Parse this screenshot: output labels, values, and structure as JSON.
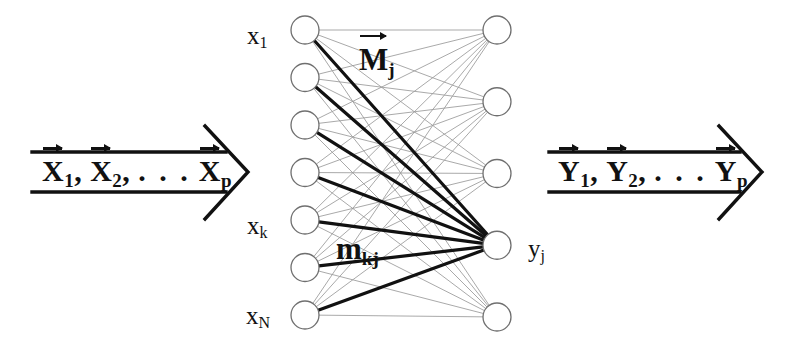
{
  "figure": {
    "kind": "neural-network-diagram",
    "background_color": "#ffffff",
    "ink_color": "#111111",
    "mesh_color": "#9a9a9a"
  },
  "input_arrow": {
    "name": "input-vector-arrow",
    "direction": "right",
    "text_main": "X",
    "items": [
      {
        "symbol": "X",
        "subscript": "1",
        "vector": true,
        "separator": ","
      },
      {
        "symbol": "X",
        "subscript": "2",
        "vector": true,
        "separator": ","
      },
      {
        "symbol": "X",
        "subscript": "p",
        "vector": true,
        "separator": ""
      }
    ],
    "ellipsis": ". . .",
    "full_text": "X1, X2, ... Xp"
  },
  "output_arrow": {
    "name": "output-vector-arrow",
    "direction": "right",
    "text_main": "Y",
    "items": [
      {
        "symbol": "Y",
        "subscript": "1",
        "vector": true,
        "separator": ","
      },
      {
        "symbol": "Y",
        "subscript": "2",
        "vector": true,
        "separator": ","
      },
      {
        "symbol": "Y",
        "subscript": "p",
        "vector": true,
        "separator": ""
      }
    ],
    "ellipsis": ". . .",
    "full_text": "Y1, Y2, ... Yp"
  },
  "input_layer": {
    "name": "input-layer",
    "node_count": 7,
    "node_radius": 14,
    "center_x": 305,
    "y_positions": [
      30,
      77.5,
      125,
      172.5,
      220,
      267.5,
      315
    ],
    "labels": [
      {
        "index": 0,
        "symbol": "x",
        "subscript": "1",
        "text": "x1"
      },
      {
        "index": 4,
        "symbol": "x",
        "subscript": "k",
        "text": "xk"
      },
      {
        "index": 6,
        "symbol": "x",
        "subscript": "N",
        "text": "xN"
      }
    ]
  },
  "output_layer": {
    "name": "output-layer",
    "node_count": 5,
    "node_radius": 14,
    "center_x": 497,
    "y_positions": [
      30,
      101.75,
      173.5,
      245.25,
      317
    ],
    "labels": [
      {
        "index": 3,
        "symbol": "y",
        "subscript": "j",
        "text": "yj"
      }
    ],
    "highlighted_index": 3
  },
  "weights": {
    "vector_label": {
      "name": "weight-vector-label",
      "symbol": "M",
      "subscript": "j",
      "vector": true,
      "text": "Mj"
    },
    "scalar_label": {
      "name": "weight-scalar-label",
      "symbol": "m",
      "subscript": "kj",
      "vector": false,
      "text": "mkj"
    }
  },
  "edges": {
    "mesh_description": "fully connected 7x5 bipartite mesh",
    "highlighted_description": "7 bold edges from all inputs to output node j"
  }
}
